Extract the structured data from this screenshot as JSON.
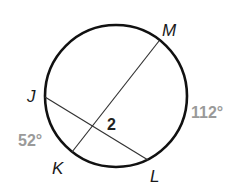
{
  "diagram": {
    "type": "circle-intersecting-chords",
    "circle": {
      "cx": 116,
      "cy": 96,
      "r": 71,
      "stroke": "#111111"
    },
    "points": {
      "M": {
        "label": "M",
        "x": 159,
        "y": 41
      },
      "J": {
        "label": "J",
        "x": 45,
        "y": 97
      },
      "K": {
        "label": "K",
        "x": 72,
        "y": 152
      },
      "L": {
        "label": "L",
        "x": 148,
        "y": 160
      }
    },
    "chords": [
      {
        "from": "M",
        "to": "K"
      },
      {
        "from": "J",
        "to": "L"
      }
    ],
    "angle_label": "2",
    "arcs": [
      {
        "name": "arc-ML",
        "measure": "112°"
      },
      {
        "name": "arc-JK",
        "measure": "52°"
      }
    ],
    "colors": {
      "line": "#111111",
      "arc_measure": "#9a9a9a"
    }
  }
}
